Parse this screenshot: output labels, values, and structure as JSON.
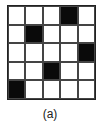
{
  "figure": {
    "caption": "(a)",
    "grid": {
      "rows": 5,
      "cols": 5,
      "filled_cells": [
        [
          0,
          3
        ],
        [
          1,
          1
        ],
        [
          2,
          4
        ],
        [
          3,
          2
        ],
        [
          4,
          0
        ]
      ],
      "filled_color": "#0a0a0a",
      "empty_color": "#ffffff"
    }
  }
}
